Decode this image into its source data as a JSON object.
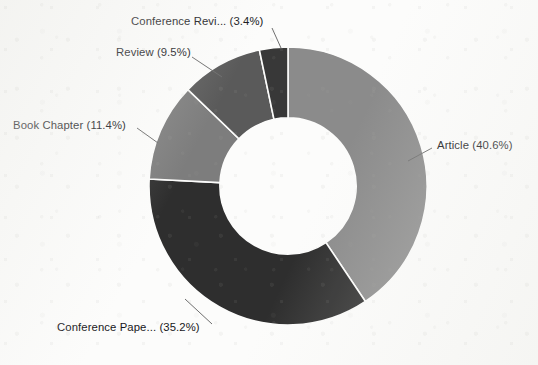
{
  "chart_data": {
    "type": "pie",
    "variant": "donut",
    "title": "",
    "subtitle": "",
    "xlabel": "",
    "ylabel": "",
    "legend_position": "none",
    "grid": false,
    "label_format": "{name} ({percent}%)",
    "start_angle_deg": 0,
    "direction": "clockwise",
    "inner_radius_ratio": 0.49,
    "categories": [
      "Article",
      "Conference Pape...",
      "Book Chapter",
      "Review",
      "Conference Revi..."
    ],
    "values": [
      40.6,
      35.2,
      11.4,
      9.5,
      3.4
    ],
    "units": "percent",
    "slices": [
      {
        "name": "Article",
        "label": "Article (40.6%)",
        "percent": 40.6,
        "color": "#8b8b8b",
        "start_deg": 0.0,
        "end_deg": 146.16,
        "label_side": "right"
      },
      {
        "name": "Conference Pape...",
        "label": "Conference Pape... (35.2%)",
        "percent": 35.2,
        "color": "#2e2e2e",
        "start_deg": 146.16,
        "end_deg": 272.88,
        "label_side": "left"
      },
      {
        "name": "Book Chapter",
        "label": "Book Chapter (11.4%)",
        "percent": 11.4,
        "color": "#7d7d7d",
        "start_deg": 272.88,
        "end_deg": 313.92,
        "label_side": "left"
      },
      {
        "name": "Review",
        "label": "Review (9.5%)",
        "percent": 9.5,
        "color": "#5a5a5a",
        "start_deg": 313.92,
        "end_deg": 348.12,
        "label_side": "left"
      },
      {
        "name": "Conference Revi...",
        "label": "Conference Revi... (3.4%)",
        "percent": 3.4,
        "color": "#383838",
        "start_deg": 348.12,
        "end_deg": 360.0,
        "label_side": "top"
      }
    ],
    "colors": [
      "#8b8b8b",
      "#2e2e2e",
      "#7d7d7d",
      "#5a5a5a",
      "#383838"
    ],
    "background_color": "#fcfcfb",
    "text_color": "#17171a",
    "leader_line_color": "#6e6e6e"
  },
  "labels": {
    "article": "Article (40.6%)",
    "conference_paper": "Conference Pape... (35.2%)",
    "book_chapter": "Book Chapter (11.4%)",
    "review": "Review (9.5%)",
    "conference_review": "Conference Revi... (3.4%)"
  }
}
